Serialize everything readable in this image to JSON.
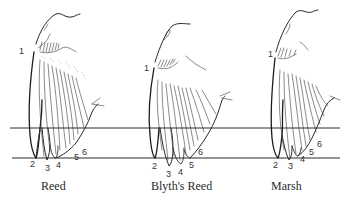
{
  "figure": {
    "type": "wing-formula-comparison",
    "reference_lines": {
      "upper_y": 128,
      "lower_y": 158,
      "x_start": 10,
      "x_end": 340
    },
    "wings": [
      {
        "caption": "Reed",
        "primary_labels": [
          "1",
          "2",
          "3",
          "4",
          "5",
          "6"
        ]
      },
      {
        "caption": "Blyth's Reed",
        "primary_labels": [
          "1",
          "2",
          "3",
          "4",
          "5",
          "6"
        ]
      },
      {
        "caption": "Marsh",
        "primary_labels": [
          "1",
          "2",
          "3",
          "4",
          "5",
          "6"
        ]
      }
    ]
  },
  "colors": {
    "ink": "#2a2a2a",
    "background": "#ffffff"
  }
}
